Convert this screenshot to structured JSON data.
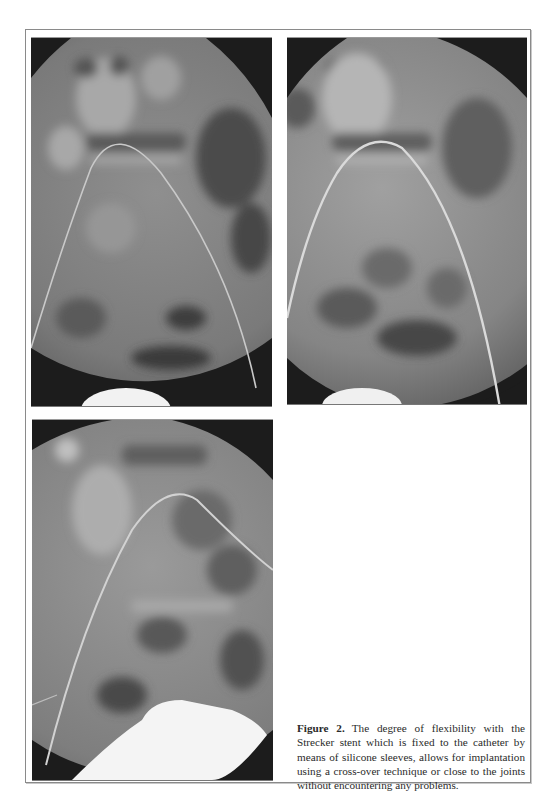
{
  "figure": {
    "label": "Figure 2.",
    "caption": "The degree of flexibility with the Strecker stent which is fixed to the catheter by means of silicone sleeves, allows for implantation using a cross-over technique or close to the joints without encountering any problems.",
    "panels": [
      {
        "id": "a",
        "description": "Fluoroscopy image, catheter arching over pelvis, bladder contrast at bottom center"
      },
      {
        "id": "b",
        "description": "Fluoroscopy image, catheter arching over pelvis, bladder contrast at bottom center"
      },
      {
        "id": "c",
        "description": "Fluoroscopy image, catheter arching right, large bladder contrast bottom right"
      }
    ]
  },
  "colors": {
    "background": "#ffffff",
    "frame_border": "#8a8a8a",
    "xray_dark": "#1c1c1c",
    "xray_mid": "#7a7a7a",
    "xray_light": "#b8b8b8",
    "contrast": "#f2f2f2",
    "caption_text": "#2a2a2a"
  }
}
